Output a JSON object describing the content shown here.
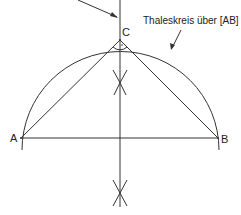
{
  "diagram": {
    "type": "geometric-construction",
    "points": {
      "A": {
        "label": "A",
        "x": 21,
        "y": 138
      },
      "B": {
        "label": "B",
        "x": 218,
        "y": 138
      },
      "C": {
        "label": "C",
        "x": 120,
        "y": 40
      }
    },
    "annotation": "Thaleskreis über [AB]",
    "right_angle_marker": "·",
    "colors": {
      "stroke": "#333333",
      "background": "#ffffff"
    }
  }
}
